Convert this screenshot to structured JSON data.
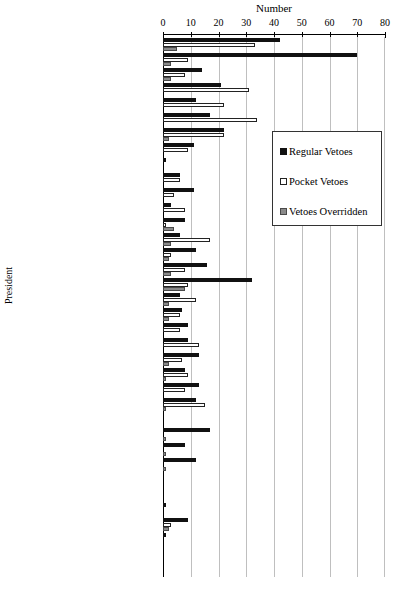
{
  "chart_data": {
    "type": "bar",
    "orientation": "horizontal",
    "title": "",
    "xlabel": "Number",
    "ylabel": "President",
    "xlim": [
      0,
      80
    ],
    "xticks": [
      0,
      10,
      20,
      30,
      40,
      50,
      60,
      70,
      80
    ],
    "grid": true,
    "legend_position": "right-upper",
    "legend": [
      "Regular Vetoes",
      "Pocket Vetoes",
      "Vetoes Overridden"
    ],
    "colors": {
      "regular": "#111111",
      "pocket": "#ffffff",
      "override": "#8a8a8a",
      "grid": "#bfbfbf",
      "axis": "#000000"
    },
    "categories": [
      "Truman (1947-1948)*",
      "Truman (1949-1950)",
      "Truman (1951-1952)",
      "Eisenhower (1953-1954)",
      "Eisenhower (1955-1956)**",
      "Eisenhower (1957-1958)**",
      "Eisenhower (1959-1960)**",
      "Kennedy (1961-1962)",
      "Kennedy (1963)",
      "Johnson (1963-1964)",
      "Johnson (1965-1966)",
      "Johnson (1967-1968)",
      "Nixon (1969-1970)**",
      "Nixon (1971-1972)**",
      "Nixon (1973-1974)**",
      "Ford (1974)**",
      "Ford (1975-1976)**",
      "Carter (1977-1978)",
      "Carter (1979-1980)",
      "Reagan (1981-1982)**",
      "Reagan (1983-1984)**",
      "Reagan (1985-1986)**",
      "Reagan (1987-1988)**",
      "GHW Bush (1989-1990)**",
      "GHW Bush (1991-1992)**",
      "Clinton (1993-1994)",
      "Clinton (1995-1996)*",
      "Clinton (1997-1998)*",
      "Clinton (1999-2000)*",
      "GW Bush (2001-2002)**",
      "GW Bush (2003-2004)",
      "GW Bush (2005-2006)",
      "GW Bush (2007-2008)**",
      "Obama (2009-2010)",
      "Obama (2011-2012)*",
      "Obama (2013-2014)*"
    ],
    "series": [
      {
        "name": "Regular Vetoes",
        "key": "regular",
        "values": [
          42,
          70,
          14,
          21,
          12,
          17,
          22,
          11,
          1,
          6,
          11,
          3,
          8,
          6,
          12,
          16,
          32,
          6,
          7,
          9,
          9,
          13,
          8,
          13,
          12,
          0,
          17,
          8,
          12,
          0,
          0,
          1,
          9,
          1,
          0,
          0
        ]
      },
      {
        "name": "Pocket Vetoes",
        "key": "pocket",
        "values": [
          33,
          9,
          8,
          31,
          22,
          34,
          22,
          9,
          0,
          6,
          4,
          8,
          1,
          17,
          3,
          8,
          9,
          12,
          6,
          6,
          13,
          7,
          9,
          8,
          15,
          0,
          0,
          0,
          0,
          0,
          0,
          0,
          3,
          0,
          0,
          0
        ]
      },
      {
        "name": "Vetoes Overridden",
        "key": "override",
        "values": [
          5,
          3,
          3,
          0,
          0,
          0,
          2,
          0,
          0,
          0,
          0,
          0,
          4,
          3,
          2,
          3,
          8,
          2,
          2,
          0,
          0,
          2,
          1,
          0,
          1,
          0,
          1,
          1,
          1,
          0,
          0,
          0,
          2,
          0,
          0,
          0
        ]
      }
    ]
  }
}
